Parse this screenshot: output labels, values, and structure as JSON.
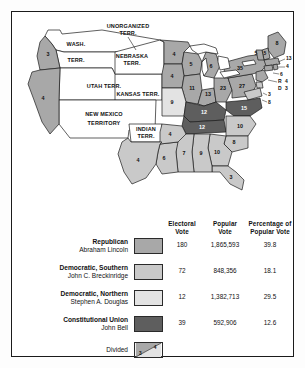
{
  "figure": {
    "colors": {
      "republican": "#a8a8a8",
      "democratic_southern": "#c9c9c9",
      "democratic_northern": "#e3e3e3",
      "constitutional_union": "#5e5e5e",
      "territory": "#ffffff",
      "water": "#ffffff",
      "outline": "#1b1b1b"
    }
  },
  "legend": {
    "columns": {
      "electoral": "Electoral\nVote",
      "electoral_line1": "Electoral",
      "electoral_line2": "Vote",
      "popular_line1": "Popular",
      "popular_line2": "Vote",
      "percent_line1": "Percentage of",
      "percent_line2": "Popular Vote"
    },
    "rows": [
      {
        "party": "Republican",
        "candidate": "Abraham Lincoln",
        "electoral_vote": "180",
        "popular_vote": "1,865,593",
        "percent": "39.8",
        "color": "#a8a8a8"
      },
      {
        "party": "Democratic, Southern",
        "candidate": "John C. Breckinridge",
        "electoral_vote": "72",
        "popular_vote": "848,356",
        "percent": "18.1",
        "color": "#c9c9c9"
      },
      {
        "party": "Democratic, Northern",
        "candidate": "Stephen A. Douglas",
        "electoral_vote": "12",
        "popular_vote": "1,382,713",
        "percent": "29.5",
        "color": "#e3e3e3"
      },
      {
        "party": "Constitutional Union",
        "candidate": "John Bell",
        "electoral_vote": "39",
        "popular_vote": "592,906",
        "percent": "12.6",
        "color": "#5e5e5e"
      }
    ],
    "divided": {
      "label": "Divided",
      "left_value": "3",
      "right_value": "4"
    }
  },
  "map": {
    "territories": [
      {
        "name": "washington-territory",
        "line1": "WASH.",
        "line2": "TERR."
      },
      {
        "name": "unorganized-territory",
        "line1": "UNORGANIZED",
        "line2": "TERR."
      },
      {
        "name": "nebraska-territory",
        "line1": "NEBRASKA",
        "line2": "TERR."
      },
      {
        "name": "utah-territory",
        "line1": "UTAH TERR.",
        "line2": ""
      },
      {
        "name": "kansas-territory",
        "line1": "KANSAS TERR.",
        "line2": ""
      },
      {
        "name": "new-mexico-territory",
        "line1": "NEW MEXICO",
        "line2": "TERRITORY"
      },
      {
        "name": "indian-territory",
        "line1": "INDIAN",
        "line2": "TERR."
      }
    ],
    "states": [
      {
        "name": "oregon",
        "votes": "3",
        "party": "republican"
      },
      {
        "name": "california",
        "votes": "4",
        "party": "republican"
      },
      {
        "name": "minnesota",
        "votes": "4",
        "party": "republican"
      },
      {
        "name": "wisconsin",
        "votes": "5",
        "party": "republican"
      },
      {
        "name": "michigan",
        "votes": "6",
        "party": "republican"
      },
      {
        "name": "iowa",
        "votes": "4",
        "party": "republican"
      },
      {
        "name": "illinois",
        "votes": "11",
        "party": "republican"
      },
      {
        "name": "indiana",
        "votes": "13",
        "party": "republican"
      },
      {
        "name": "ohio",
        "votes": "23",
        "party": "republican"
      },
      {
        "name": "pennsylvania",
        "votes": "27",
        "party": "republican"
      },
      {
        "name": "new-york",
        "votes": "35",
        "party": "republican"
      },
      {
        "name": "maine",
        "votes": "8",
        "party": "republican"
      },
      {
        "name": "new-hampshire",
        "votes": "5",
        "party": "republican"
      },
      {
        "name": "vermont",
        "votes": "5",
        "party": "republican"
      },
      {
        "name": "massachusetts",
        "votes": "13",
        "party": "republican"
      },
      {
        "name": "rhode-island",
        "votes": "4",
        "party": "republican"
      },
      {
        "name": "connecticut",
        "votes": "6",
        "party": "republican"
      },
      {
        "name": "missouri",
        "votes": "9",
        "party": "democratic-northern"
      },
      {
        "name": "new-jersey-rep",
        "votes": "4",
        "party": "republican",
        "prefix": "R"
      },
      {
        "name": "new-jersey-dem",
        "votes": "3",
        "party": "democratic-northern",
        "prefix": "D"
      },
      {
        "name": "delaware",
        "votes": "3",
        "party": "democratic-southern"
      },
      {
        "name": "maryland",
        "votes": "8",
        "party": "democratic-southern"
      },
      {
        "name": "virginia",
        "votes": "15",
        "party": "constitutional-union"
      },
      {
        "name": "kentucky",
        "votes": "12",
        "party": "constitutional-union"
      },
      {
        "name": "tennessee",
        "votes": "12",
        "party": "constitutional-union"
      },
      {
        "name": "north-carolina",
        "votes": "10",
        "party": "democratic-southern"
      },
      {
        "name": "south-carolina",
        "votes": "8",
        "party": "democratic-southern"
      },
      {
        "name": "georgia",
        "votes": "10",
        "party": "democratic-southern"
      },
      {
        "name": "florida",
        "votes": "3",
        "party": "democratic-southern"
      },
      {
        "name": "alabama",
        "votes": "9",
        "party": "democratic-southern"
      },
      {
        "name": "mississippi",
        "votes": "7",
        "party": "democratic-southern"
      },
      {
        "name": "louisiana",
        "votes": "6",
        "party": "democratic-southern"
      },
      {
        "name": "arkansas",
        "votes": "4",
        "party": "democratic-southern"
      },
      {
        "name": "texas",
        "votes": "4",
        "party": "democratic-southern"
      }
    ]
  }
}
